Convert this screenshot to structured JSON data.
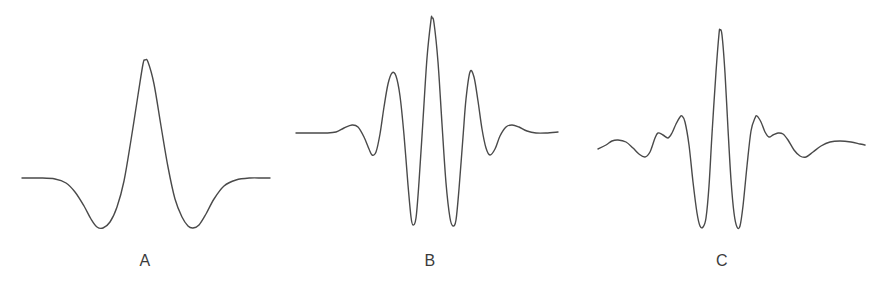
{
  "figure": {
    "background_color": "#ffffff",
    "stroke_color": "#4a4a4a",
    "label_color": "#3b3b3b",
    "width": 884,
    "height": 292
  },
  "panels": [
    {
      "id": "panel-a",
      "label": "A",
      "label_x": 145,
      "label_y": 252
    },
    {
      "id": "panel-b",
      "label": "B",
      "label_x": 430,
      "label_y": 252
    },
    {
      "id": "panel-c",
      "label": "C",
      "label_x": 722,
      "label_y": 252
    }
  ],
  "chart_data": {
    "type": "line",
    "title": "",
    "xlabel": "",
    "ylabel": "",
    "grid": false,
    "legend": "none",
    "axis_visible": false,
    "xlim": [
      0,
      884
    ],
    "ylim": [
      292,
      0
    ],
    "series": [
      {
        "name": "A",
        "shape": "single-cycle wavelet (Ricker / Mexican-hat like): flat tails, one tall central positive peak flanked by two shallow negative troughs",
        "baseline_y": 178,
        "x_start": 22,
        "x_end": 270,
        "center_x": 145,
        "peak_y": 60,
        "trough_y": 227,
        "extrema": [
          {
            "x": 97,
            "y": 227,
            "kind": "trough"
          },
          {
            "x": 145,
            "y": 60,
            "kind": "peak"
          },
          {
            "x": 192,
            "y": 227,
            "kind": "trough"
          }
        ],
        "points": [
          [
            22,
            178
          ],
          [
            40,
            178
          ],
          [
            55,
            179
          ],
          [
            66,
            183
          ],
          [
            75,
            192
          ],
          [
            84,
            206
          ],
          [
            91,
            219
          ],
          [
            97,
            227
          ],
          [
            103,
            228
          ],
          [
            110,
            222
          ],
          [
            117,
            207
          ],
          [
            124,
            181
          ],
          [
            131,
            140
          ],
          [
            138,
            95
          ],
          [
            143,
            64
          ],
          [
            145,
            60
          ],
          [
            148,
            62
          ],
          [
            154,
            84
          ],
          [
            161,
            126
          ],
          [
            168,
            167
          ],
          [
            175,
            199
          ],
          [
            182,
            217
          ],
          [
            188,
            226
          ],
          [
            193,
            228
          ],
          [
            199,
            225
          ],
          [
            206,
            214
          ],
          [
            214,
            199
          ],
          [
            224,
            186
          ],
          [
            236,
            180
          ],
          [
            250,
            178
          ],
          [
            262,
            178
          ],
          [
            270,
            178
          ]
        ]
      },
      {
        "name": "B",
        "shape": "symmetric Gabor / Morlet wavelet: flat tails, small outer bumps, two large side lobes and a very tall narrow central peak, overall 5 visible positive lobes",
        "baseline_y": 132,
        "x_start": 296,
        "x_end": 558,
        "center_x": 432,
        "peak_y": 18,
        "trough_y": 227,
        "extrema": [
          {
            "x": 352,
            "y": 125,
            "kind": "peak"
          },
          {
            "x": 372,
            "y": 155,
            "kind": "trough"
          },
          {
            "x": 392,
            "y": 73,
            "kind": "peak"
          },
          {
            "x": 412,
            "y": 225,
            "kind": "trough"
          },
          {
            "x": 432,
            "y": 18,
            "kind": "peak"
          },
          {
            "x": 452,
            "y": 226,
            "kind": "trough"
          },
          {
            "x": 470,
            "y": 72,
            "kind": "peak"
          },
          {
            "x": 490,
            "y": 155,
            "kind": "trough"
          },
          {
            "x": 510,
            "y": 125,
            "kind": "peak"
          },
          {
            "x": 558,
            "y": 132,
            "kind": "tail"
          }
        ],
        "points": [
          [
            296,
            133
          ],
          [
            312,
            133
          ],
          [
            326,
            133
          ],
          [
            336,
            132
          ],
          [
            344,
            128
          ],
          [
            352,
            125
          ],
          [
            358,
            127
          ],
          [
            364,
            137
          ],
          [
            369,
            149
          ],
          [
            372,
            155
          ],
          [
            376,
            152
          ],
          [
            380,
            134
          ],
          [
            384,
            107
          ],
          [
            388,
            84
          ],
          [
            392,
            73
          ],
          [
            396,
            76
          ],
          [
            400,
            96
          ],
          [
            404,
            135
          ],
          [
            408,
            185
          ],
          [
            411,
            217
          ],
          [
            413,
            225
          ],
          [
            416,
            218
          ],
          [
            419,
            182
          ],
          [
            423,
            120
          ],
          [
            427,
            58
          ],
          [
            431,
            20
          ],
          [
            432,
            18
          ],
          [
            434,
            23
          ],
          [
            438,
            62
          ],
          [
            442,
            124
          ],
          [
            446,
            183
          ],
          [
            450,
            218
          ],
          [
            453,
            226
          ],
          [
            456,
            220
          ],
          [
            459,
            189
          ],
          [
            463,
            137
          ],
          [
            466,
            99
          ],
          [
            470,
            72
          ],
          [
            474,
            77
          ],
          [
            478,
            101
          ],
          [
            482,
            129
          ],
          [
            486,
            148
          ],
          [
            490,
            155
          ],
          [
            495,
            149
          ],
          [
            500,
            136
          ],
          [
            506,
            127
          ],
          [
            512,
            125
          ],
          [
            519,
            127
          ],
          [
            527,
            131
          ],
          [
            536,
            133
          ],
          [
            546,
            133
          ],
          [
            558,
            132
          ]
        ]
      },
      {
        "name": "C",
        "shape": "sinc-like wavelet: broad rippling tails with several small decaying lobes and a very tall narrow central peak flanked by two deep troughs",
        "baseline_y": 144,
        "x_start": 598,
        "x_end": 865,
        "center_x": 720,
        "peak_y": 30,
        "trough_y": 227,
        "extrema": [
          {
            "x": 616,
            "y": 140,
            "kind": "peak"
          },
          {
            "x": 645,
            "y": 157,
            "kind": "trough"
          },
          {
            "x": 658,
            "y": 133,
            "kind": "peak"
          },
          {
            "x": 669,
            "y": 137,
            "kind": "trough"
          },
          {
            "x": 682,
            "y": 116,
            "kind": "peak"
          },
          {
            "x": 701,
            "y": 227,
            "kind": "trough"
          },
          {
            "x": 720,
            "y": 30,
            "kind": "peak"
          },
          {
            "x": 737,
            "y": 227,
            "kind": "trough"
          },
          {
            "x": 757,
            "y": 116,
            "kind": "peak"
          },
          {
            "x": 770,
            "y": 137,
            "kind": "trough"
          },
          {
            "x": 782,
            "y": 133,
            "kind": "peak"
          },
          {
            "x": 802,
            "y": 157,
            "kind": "trough"
          },
          {
            "x": 840,
            "y": 141,
            "kind": "peak"
          }
        ],
        "points": [
          [
            598,
            149
          ],
          [
            606,
            145
          ],
          [
            612,
            141
          ],
          [
            618,
            140
          ],
          [
            626,
            142
          ],
          [
            633,
            148
          ],
          [
            639,
            154
          ],
          [
            645,
            157
          ],
          [
            650,
            152
          ],
          [
            655,
            138
          ],
          [
            658,
            133
          ],
          [
            663,
            135
          ],
          [
            668,
            138
          ],
          [
            672,
            133
          ],
          [
            676,
            124
          ],
          [
            680,
            117
          ],
          [
            682,
            116
          ],
          [
            685,
            122
          ],
          [
            689,
            145
          ],
          [
            693,
            182
          ],
          [
            697,
            213
          ],
          [
            700,
            226
          ],
          [
            703,
            227
          ],
          [
            706,
            218
          ],
          [
            709,
            186
          ],
          [
            712,
            134
          ],
          [
            716,
            72
          ],
          [
            719,
            34
          ],
          [
            720,
            30
          ],
          [
            722,
            35
          ],
          [
            725,
            73
          ],
          [
            728,
            129
          ],
          [
            731,
            180
          ],
          [
            734,
            213
          ],
          [
            737,
            227
          ],
          [
            740,
            226
          ],
          [
            743,
            206
          ],
          [
            747,
            166
          ],
          [
            751,
            131
          ],
          [
            755,
            118
          ],
          [
            757,
            116
          ],
          [
            761,
            122
          ],
          [
            765,
            132
          ],
          [
            769,
            137
          ],
          [
            773,
            135
          ],
          [
            778,
            133
          ],
          [
            783,
            134
          ],
          [
            788,
            140
          ],
          [
            794,
            150
          ],
          [
            800,
            156
          ],
          [
            806,
            157
          ],
          [
            813,
            152
          ],
          [
            821,
            146
          ],
          [
            830,
            142
          ],
          [
            840,
            141
          ],
          [
            851,
            142
          ],
          [
            860,
            144
          ],
          [
            865,
            145
          ]
        ]
      }
    ]
  }
}
